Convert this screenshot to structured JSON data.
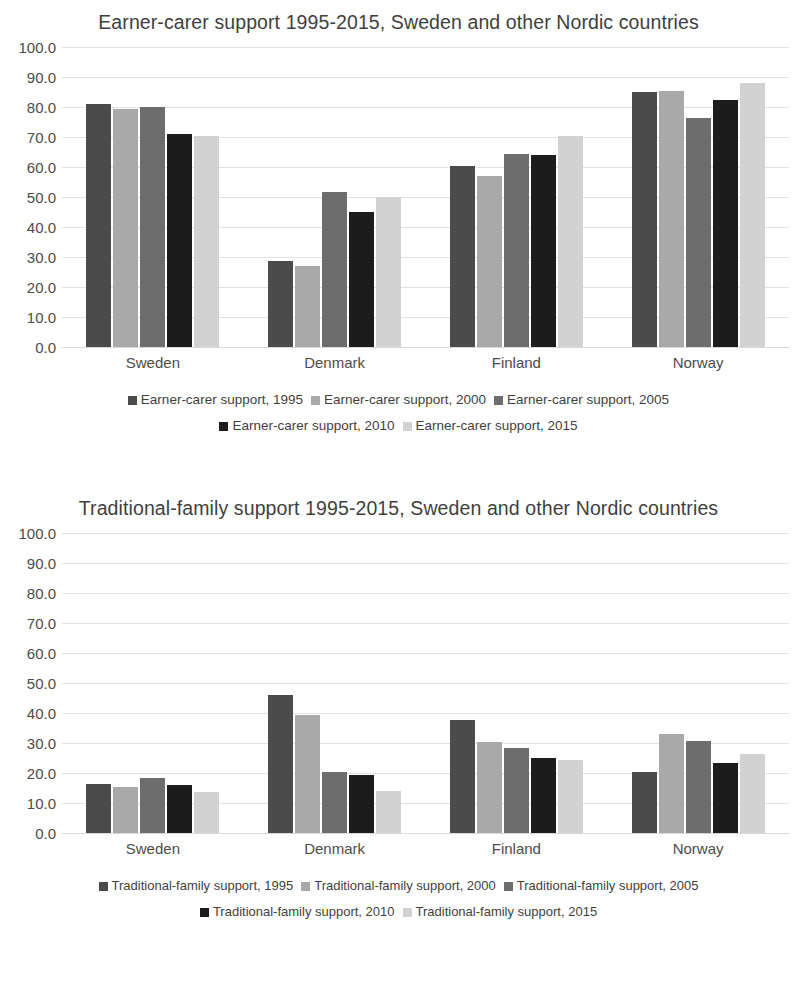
{
  "colors": {
    "series_1995": "#4b4b4b",
    "series_2000": "#a9a9a9",
    "series_2005": "#6d6d6d",
    "series_2010": "#1c1c1c",
    "series_2015": "#d2d2d2",
    "gridline": "#e2e2e2",
    "text": "#404040",
    "background": "#ffffff"
  },
  "charts": [
    {
      "id": "earner-carer",
      "chart_data": {
        "type": "bar",
        "title": "Earner-carer support 1995-2015, Sweden and other Nordic countries",
        "xlabel": "",
        "ylabel": "",
        "ylim": [
          0,
          100
        ],
        "ytick_labels": [
          "100.0",
          "90.0",
          "80.0",
          "70.0",
          "60.0",
          "50.0",
          "40.0",
          "30.0",
          "20.0",
          "10.0",
          "0.0"
        ],
        "yticks": [
          100,
          90,
          80,
          70,
          60,
          50,
          40,
          30,
          20,
          10,
          0
        ],
        "grid": true,
        "legend_position": "bottom",
        "categories": [
          "Sweden",
          "Denmark",
          "Finland",
          "Norway"
        ],
        "series": [
          {
            "name": "Earner-carer support, 1995",
            "color": "#4b4b4b",
            "values": [
              81.0,
              28.7,
              60.5,
              85.0
            ]
          },
          {
            "name": "Earner-carer support, 2000",
            "color": "#a9a9a9",
            "values": [
              79.5,
              27.0,
              57.0,
              85.5
            ]
          },
          {
            "name": "Earner-carer support, 2005",
            "color": "#6d6d6d",
            "values": [
              80.0,
              51.8,
              64.2,
              76.5
            ]
          },
          {
            "name": "Earner-carer support, 2010",
            "color": "#1c1c1c",
            "values": [
              71.0,
              45.0,
              64.0,
              82.5
            ]
          },
          {
            "name": "Earner-carer support, 2015",
            "color": "#d2d2d2",
            "values": [
              70.5,
              50.0,
              70.5,
              88.0
            ]
          }
        ]
      }
    },
    {
      "id": "traditional-family",
      "chart_data": {
        "type": "bar",
        "title": "Traditional-family support 1995-2015, Sweden and other Nordic countries",
        "xlabel": "",
        "ylabel": "",
        "ylim": [
          0,
          100
        ],
        "ytick_labels": [
          "100.0",
          "90.0",
          "80.0",
          "70.0",
          "60.0",
          "50.0",
          "40.0",
          "30.0",
          "20.0",
          "10.0",
          "0.0"
        ],
        "yticks": [
          100,
          90,
          80,
          70,
          60,
          50,
          40,
          30,
          20,
          10,
          0
        ],
        "grid": true,
        "legend_position": "bottom",
        "categories": [
          "Sweden",
          "Denmark",
          "Finland",
          "Norway"
        ],
        "series": [
          {
            "name": "Traditional-family support, 1995",
            "color": "#4b4b4b",
            "values": [
              16.2,
              46.0,
              37.8,
              20.2
            ]
          },
          {
            "name": "Traditional-family support, 2000",
            "color": "#a9a9a9",
            "values": [
              15.3,
              39.5,
              30.2,
              33.0
            ]
          },
          {
            "name": "Traditional-family support, 2005",
            "color": "#6d6d6d",
            "values": [
              18.2,
              20.3,
              28.3,
              30.6
            ]
          },
          {
            "name": "Traditional-family support, 2010",
            "color": "#1c1c1c",
            "values": [
              16.0,
              19.5,
              25.0,
              23.5
            ]
          },
          {
            "name": "Traditional-family support, 2015",
            "color": "#d2d2d2",
            "values": [
              13.6,
              14.0,
              24.2,
              26.3
            ]
          }
        ]
      }
    }
  ]
}
